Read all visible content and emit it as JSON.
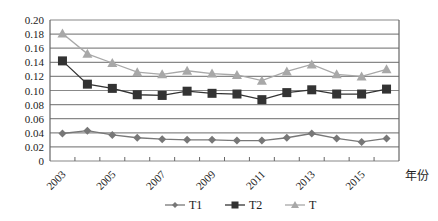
{
  "chart_data": {
    "type": "line",
    "title": "",
    "xlabel": "年份",
    "ylabel": "",
    "ylim": [
      0,
      0.2
    ],
    "yticks": [
      "0",
      "0.02",
      "0.04",
      "0.06",
      "0.08",
      "0.10",
      "0.12",
      "0.14",
      "0.16",
      "0.18",
      "0.20"
    ],
    "x": [
      2003,
      2004,
      2005,
      2006,
      2007,
      2008,
      2009,
      2010,
      2011,
      2012,
      2013,
      2014,
      2015,
      2016
    ],
    "xtick_labels": [
      "2003",
      "2005",
      "2007",
      "2009",
      "2011",
      "2013",
      "2015"
    ],
    "grid": true,
    "legend_position": "bottom",
    "series": [
      {
        "name": "T1",
        "marker": "diamond",
        "color": "#777777",
        "values": [
          0.039,
          0.043,
          0.037,
          0.033,
          0.031,
          0.03,
          0.03,
          0.029,
          0.029,
          0.033,
          0.039,
          0.032,
          0.027,
          0.032
        ]
      },
      {
        "name": "T2",
        "marker": "square",
        "color": "#333333",
        "values": [
          0.142,
          0.109,
          0.103,
          0.094,
          0.093,
          0.099,
          0.096,
          0.095,
          0.087,
          0.097,
          0.101,
          0.095,
          0.095,
          0.102
        ]
      },
      {
        "name": "T",
        "marker": "triangle",
        "color": "#a8a8a8",
        "values": [
          0.181,
          0.152,
          0.139,
          0.126,
          0.123,
          0.128,
          0.124,
          0.122,
          0.114,
          0.127,
          0.137,
          0.123,
          0.12,
          0.13
        ]
      }
    ]
  }
}
